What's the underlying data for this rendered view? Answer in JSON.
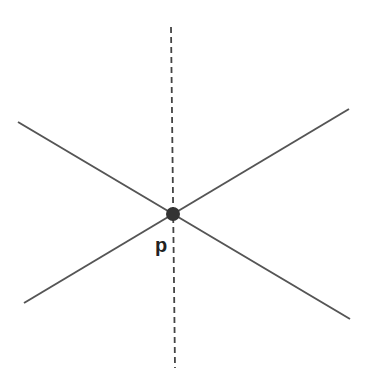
{
  "diagram": {
    "width": 373,
    "height": 386,
    "background": "#ffffff",
    "line_color": "#555555",
    "point_color": "#333333",
    "lines": [
      {
        "name": "line-descending",
        "style": "solid",
        "x1": 18,
        "y1": 122,
        "x2": 350,
        "y2": 319
      },
      {
        "name": "line-ascending",
        "style": "solid",
        "x1": 24,
        "y1": 303,
        "x2": 349,
        "y2": 109
      },
      {
        "name": "line-vertical",
        "style": "dashed",
        "x1": 171,
        "y1": 27,
        "x2": 175,
        "y2": 368
      }
    ],
    "point": {
      "cx": 173,
      "cy": 214,
      "r": 7
    },
    "point_label": {
      "text": "p",
      "x": 155,
      "y": 252
    }
  }
}
